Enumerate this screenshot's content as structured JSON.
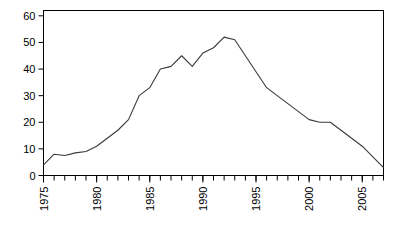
{
  "chart_data": {
    "type": "line",
    "title": "",
    "subtitle": "",
    "xlabel": "",
    "ylabel": "",
    "xlim": [
      1975,
      2007
    ],
    "ylim": [
      0,
      62
    ],
    "grid": false,
    "legend": null,
    "ytick_labels": [
      "0",
      "10",
      "20",
      "30",
      "40",
      "50",
      "60"
    ],
    "ytick_values": [
      0,
      10,
      20,
      30,
      40,
      50,
      60
    ],
    "xtick_labels": [
      "1975",
      "1980",
      "1985",
      "1990",
      "1995",
      "2000",
      "2005"
    ],
    "xtick_values": [
      1975,
      1980,
      1985,
      1990,
      1995,
      2000,
      2005
    ],
    "xtick_rotation": 90,
    "minor_xticks_every": 1,
    "line_color": "#3a3a3a",
    "axis_color": "#000000",
    "background": "#ffffff",
    "x": [
      1975,
      1976,
      1977,
      1978,
      1979,
      1980,
      1981,
      1982,
      1983,
      1984,
      1985,
      1986,
      1987,
      1988,
      1989,
      1990,
      1991,
      1992,
      1993,
      1994,
      1995,
      1996,
      1997,
      1998,
      1999,
      2000,
      2001,
      2002,
      2003,
      2004,
      2005,
      2006,
      2007
    ],
    "values": [
      4,
      8,
      7.5,
      8.5,
      9,
      11,
      14,
      17,
      21,
      30,
      33,
      40,
      41,
      45,
      41,
      46,
      48,
      52,
      51,
      45,
      39,
      33,
      30,
      27,
      24,
      21,
      20,
      20,
      17,
      14,
      11,
      7,
      3
    ],
    "series": [
      {
        "name": "series-1",
        "values": [
          4,
          8,
          7.5,
          8.5,
          9,
          11,
          14,
          17,
          21,
          30,
          33,
          40,
          41,
          45,
          41,
          46,
          48,
          52,
          51,
          45,
          39,
          33,
          30,
          27,
          24,
          21,
          20,
          20,
          17,
          14,
          11,
          7,
          3
        ]
      }
    ]
  },
  "figure": {
    "name": "line-chart"
  }
}
